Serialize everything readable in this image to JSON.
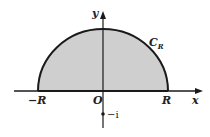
{
  "diagram": {
    "colors": {
      "fill": "#cfcfcf",
      "stroke": "#1a1a1a"
    },
    "labels": {
      "y_axis": "y",
      "x_axis": "x",
      "curve": "C",
      "curve_sub": "R",
      "origin": "O",
      "neg_r": "−R",
      "pos_r": "R",
      "point": "−i"
    }
  }
}
